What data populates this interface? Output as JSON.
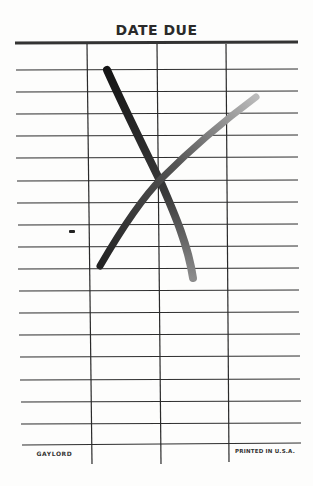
{
  "card": {
    "title": "DATE DUE",
    "footer_left": "GAYLORD",
    "footer_right": "PRINTED IN U.S.A.",
    "columns": 4,
    "rows": 18,
    "entries": [],
    "mark": "crossed-out (large hand-drawn X)",
    "colors": {
      "ink": "#2b2b2b",
      "paper": "#fdfdfc",
      "x_mark_dark": "#1e1e1e",
      "x_mark_light": "#8a8a8a"
    }
  }
}
